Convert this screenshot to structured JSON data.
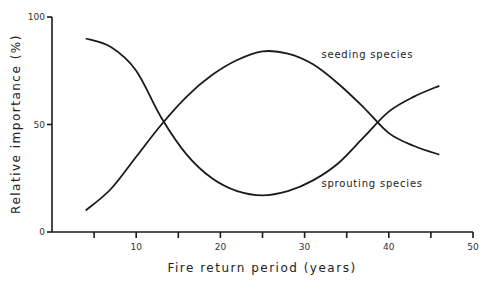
{
  "chart_data": {
    "type": "line",
    "title": "",
    "xlabel": "Fire return period (years)",
    "ylabel": "Relative importance (%)",
    "xlim": [
      0,
      50
    ],
    "ylim": [
      0,
      100
    ],
    "grid": false,
    "legend": "none (inline annotations)",
    "x_ticks": [
      5,
      10,
      15,
      20,
      25,
      30,
      35,
      40,
      45,
      50
    ],
    "x_tick_labels": [
      {
        "value": 10,
        "label": "10"
      },
      {
        "value": 20,
        "label": "20"
      },
      {
        "value": 30,
        "label": "30"
      },
      {
        "value": 40,
        "label": "40"
      },
      {
        "value": 50,
        "label": "50"
      }
    ],
    "y_tick_labels": [
      {
        "value": 0,
        "label": "0"
      },
      {
        "value": 50,
        "label": "50"
      },
      {
        "value": 100,
        "label": "100"
      }
    ],
    "series": [
      {
        "name": "seeding species",
        "annotation": "seeding species",
        "annotation_at": [
          32,
          81
        ],
        "x": [
          4,
          7,
          10,
          13,
          16,
          19,
          22,
          25,
          28,
          31,
          34,
          37,
          40,
          43,
          46
        ],
        "values": [
          10,
          20,
          35,
          50,
          63,
          73,
          80,
          84,
          83,
          78,
          69,
          58,
          46,
          40,
          36
        ]
      },
      {
        "name": "sprouting species",
        "annotation": "sprouting species",
        "annotation_at": [
          32,
          21
        ],
        "x": [
          4,
          7,
          10,
          13,
          16,
          19,
          22,
          25,
          28,
          31,
          34,
          37,
          40,
          43,
          46
        ],
        "values": [
          90,
          86,
          75,
          53,
          36,
          25,
          19,
          17,
          19,
          24,
          32,
          44,
          56,
          63,
          68
        ]
      }
    ]
  }
}
